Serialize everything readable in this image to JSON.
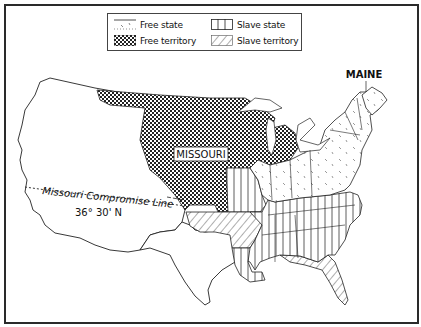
{
  "map": {
    "title_labels": {
      "missouri": "MISSOURI",
      "maine": "MAINE",
      "compromise_line": "Missouri Compromise Line",
      "latitude": "36° 30' N"
    },
    "legend": {
      "items": [
        {
          "key": "free_state",
          "label": "Free state",
          "pattern": "blank-with-hatch-marks"
        },
        {
          "key": "slave_state",
          "label": "Slave state",
          "pattern": "vertical-lines"
        },
        {
          "key": "free_territory",
          "label": "Free territory",
          "pattern": "checkerboard"
        },
        {
          "key": "slave_territory",
          "label": "Slave territory",
          "pattern": "diagonal-lines"
        }
      ]
    },
    "colors": {
      "ink": "#1a1a1a",
      "background": "#ffffff",
      "frame": "#2a2a2a"
    }
  }
}
